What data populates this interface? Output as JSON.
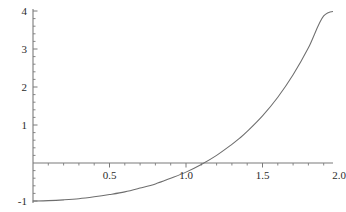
{
  "chart_data": {
    "type": "line",
    "title": "",
    "subtitle": "",
    "xlabel": "",
    "ylabel": "",
    "xlim": [
      0,
      2.05
    ],
    "ylim": [
      -1.05,
      4.05
    ],
    "grid": false,
    "legend": null,
    "legend_position": "none",
    "axis_color": "#7a7a7a",
    "curve_color": "#6e6e6e",
    "background_color": "#ffffff",
    "x_ticks_major": [
      0.5,
      1.0,
      1.5,
      2.0
    ],
    "x_tick_labels": [
      "0.5",
      "1.0",
      "1.5",
      "2.0"
    ],
    "x_ticks_minor": [
      0.1,
      0.2,
      0.3,
      0.4,
      0.6,
      0.7,
      0.8,
      0.9,
      1.1,
      1.2,
      1.3,
      1.4,
      1.6,
      1.7,
      1.8,
      1.9
    ],
    "y_ticks_major": [
      -1,
      1,
      2,
      3,
      4
    ],
    "y_tick_labels": [
      "-1",
      "1",
      "2",
      "3",
      "4"
    ],
    "y_ticks_minor": [
      -0.8,
      -0.6,
      -0.4,
      -0.2,
      0.2,
      0.4,
      0.6,
      0.8,
      1.2,
      1.4,
      1.6,
      1.8,
      2.2,
      2.4,
      2.6,
      2.8,
      3.2,
      3.4,
      3.6,
      3.8
    ],
    "x_axis_at_y": 0,
    "y_axis_at_x": 0,
    "zero_crossing_x": 1.35,
    "series": [
      {
        "name": "curve",
        "x": [
          0.0,
          0.1,
          0.2,
          0.3,
          0.4,
          0.5,
          0.6,
          0.7,
          0.8,
          0.9,
          1.0,
          1.1,
          1.2,
          1.3,
          1.35,
          1.4,
          1.5,
          1.6,
          1.7,
          1.8,
          1.9,
          2.0
        ],
        "values": [
          -1.0,
          -0.99,
          -0.97,
          -0.94,
          -0.89,
          -0.83,
          -0.76,
          -0.66,
          -0.55,
          -0.4,
          -0.24,
          -0.04,
          0.2,
          0.49,
          0.65,
          0.83,
          1.24,
          1.73,
          2.32,
          3.03,
          3.87,
          4.0
        ]
      }
    ]
  },
  "axes": {
    "x_labels": [
      {
        "text": "0.5",
        "value": 0.5
      },
      {
        "text": "1.0",
        "value": 1.0
      },
      {
        "text": "1.5",
        "value": 1.5
      },
      {
        "text": "2.0",
        "value": 2.0
      }
    ],
    "y_labels": [
      {
        "text": "4",
        "value": 4
      },
      {
        "text": "3",
        "value": 3
      },
      {
        "text": "2",
        "value": 2
      },
      {
        "text": "1",
        "value": 1
      },
      {
        "text": "-1",
        "value": -1
      }
    ]
  }
}
